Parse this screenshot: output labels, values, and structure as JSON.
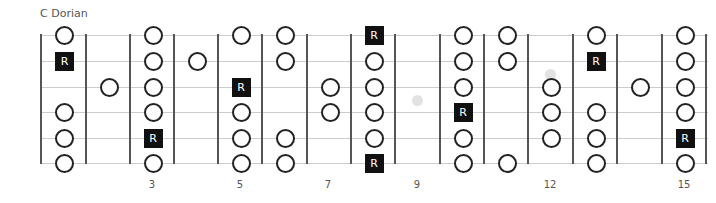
{
  "title": "C Dorian",
  "colors": {
    "note_border": "#222222",
    "root_fill": "#111111",
    "string": "#cccccc",
    "fret": "#555555",
    "inlay": "#e2e2e2"
  },
  "root_label": "R",
  "strings_y": [
    35,
    61,
    87,
    112,
    138,
    163
  ],
  "frets_x": [
    41,
    86,
    130,
    174,
    218,
    262,
    307,
    351,
    395,
    440,
    484,
    528,
    573,
    617,
    662,
    706
  ],
  "fret_numbers": [
    {
      "label": "3",
      "x": 152
    },
    {
      "label": "5",
      "x": 240
    },
    {
      "label": "7",
      "x": 328
    },
    {
      "label": "9",
      "x": 417
    },
    {
      "label": "12",
      "x": 550
    },
    {
      "label": "15",
      "x": 684
    }
  ],
  "inlays": [
    {
      "x": 417,
      "y": 100
    },
    {
      "x": 550,
      "y": 74
    }
  ],
  "notes": [
    {
      "col": 0,
      "string": 1,
      "type": "note"
    },
    {
      "col": 0,
      "string": 2,
      "type": "root"
    },
    {
      "col": 0,
      "string": 4,
      "type": "note"
    },
    {
      "col": 0,
      "string": 5,
      "type": "note"
    },
    {
      "col": 0,
      "string": 6,
      "type": "note"
    },
    {
      "col": 1,
      "string": 3,
      "type": "note"
    },
    {
      "col": 2,
      "string": 1,
      "type": "note"
    },
    {
      "col": 2,
      "string": 2,
      "type": "note"
    },
    {
      "col": 2,
      "string": 3,
      "type": "note"
    },
    {
      "col": 2,
      "string": 4,
      "type": "note"
    },
    {
      "col": 2,
      "string": 5,
      "type": "root"
    },
    {
      "col": 2,
      "string": 6,
      "type": "note"
    },
    {
      "col": 3,
      "string": 2,
      "type": "note"
    },
    {
      "col": 4,
      "string": 1,
      "type": "note"
    },
    {
      "col": 4,
      "string": 3,
      "type": "root"
    },
    {
      "col": 4,
      "string": 4,
      "type": "note"
    },
    {
      "col": 4,
      "string": 5,
      "type": "note"
    },
    {
      "col": 4,
      "string": 6,
      "type": "note"
    },
    {
      "col": 5,
      "string": 1,
      "type": "note"
    },
    {
      "col": 5,
      "string": 2,
      "type": "note"
    },
    {
      "col": 5,
      "string": 5,
      "type": "note"
    },
    {
      "col": 5,
      "string": 6,
      "type": "note"
    },
    {
      "col": 6,
      "string": 3,
      "type": "note"
    },
    {
      "col": 6,
      "string": 4,
      "type": "note"
    },
    {
      "col": 7,
      "string": 1,
      "type": "root"
    },
    {
      "col": 7,
      "string": 2,
      "type": "note"
    },
    {
      "col": 7,
      "string": 3,
      "type": "note"
    },
    {
      "col": 7,
      "string": 4,
      "type": "note"
    },
    {
      "col": 7,
      "string": 5,
      "type": "note"
    },
    {
      "col": 7,
      "string": 6,
      "type": "root"
    },
    {
      "col": 9,
      "string": 1,
      "type": "note"
    },
    {
      "col": 9,
      "string": 2,
      "type": "note"
    },
    {
      "col": 9,
      "string": 3,
      "type": "note"
    },
    {
      "col": 9,
      "string": 4,
      "type": "root"
    },
    {
      "col": 9,
      "string": 5,
      "type": "note"
    },
    {
      "col": 9,
      "string": 6,
      "type": "note"
    },
    {
      "col": 10,
      "string": 1,
      "type": "note"
    },
    {
      "col": 10,
      "string": 2,
      "type": "note"
    },
    {
      "col": 10,
      "string": 6,
      "type": "note"
    },
    {
      "col": 11,
      "string": 3,
      "type": "note"
    },
    {
      "col": 11,
      "string": 4,
      "type": "note"
    },
    {
      "col": 11,
      "string": 5,
      "type": "note"
    },
    {
      "col": 12,
      "string": 1,
      "type": "note"
    },
    {
      "col": 12,
      "string": 2,
      "type": "root"
    },
    {
      "col": 12,
      "string": 4,
      "type": "note"
    },
    {
      "col": 12,
      "string": 5,
      "type": "note"
    },
    {
      "col": 12,
      "string": 6,
      "type": "note"
    },
    {
      "col": 13,
      "string": 3,
      "type": "note"
    },
    {
      "col": 14,
      "string": 1,
      "type": "note"
    },
    {
      "col": 14,
      "string": 2,
      "type": "note"
    },
    {
      "col": 14,
      "string": 3,
      "type": "note"
    },
    {
      "col": 14,
      "string": 4,
      "type": "note"
    },
    {
      "col": 14,
      "string": 5,
      "type": "root"
    },
    {
      "col": 14,
      "string": 6,
      "type": "note"
    }
  ]
}
